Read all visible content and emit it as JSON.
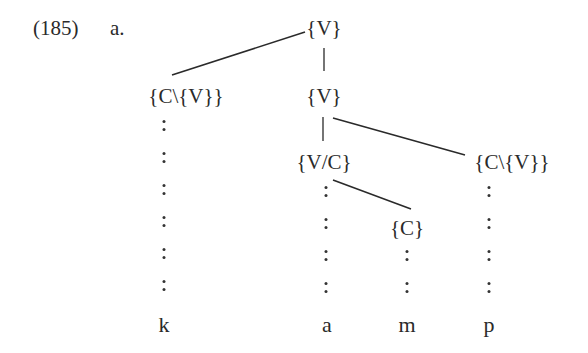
{
  "example": {
    "number": "(185)",
    "sublabel": "a."
  },
  "tree": {
    "nodes": [
      {
        "id": "root",
        "label": "{V}",
        "x": 324,
        "y": 18
      },
      {
        "id": "left-dep",
        "label": "{C\\{V}}",
        "x": 186,
        "y": 86
      },
      {
        "id": "mid",
        "label": "{V}",
        "x": 324,
        "y": 86
      },
      {
        "id": "vc",
        "label": "{V/C}",
        "x": 324,
        "y": 152
      },
      {
        "id": "right-dep",
        "label": "{C\\{V}}",
        "x": 512,
        "y": 152
      },
      {
        "id": "c",
        "label": "{C}",
        "x": 407,
        "y": 218
      }
    ],
    "edges": [
      {
        "from": "root",
        "to": "left-dep",
        "x1": 305,
        "y1": 32,
        "x2": 172,
        "y2": 75
      },
      {
        "from": "root",
        "to": "mid",
        "x1": 324,
        "y1": 48,
        "x2": 324,
        "y2": 71
      },
      {
        "from": "mid",
        "to": "vc",
        "x1": 323,
        "y1": 117,
        "x2": 323,
        "y2": 141
      },
      {
        "from": "mid",
        "to": "right-dep",
        "x1": 333,
        "y1": 118,
        "x2": 465,
        "y2": 155
      },
      {
        "from": "vc",
        "to": "c",
        "x1": 333,
        "y1": 180,
        "x2": 411,
        "y2": 209
      }
    ],
    "leaves": [
      {
        "label": "k",
        "x": 164
      },
      {
        "label": "a",
        "x": 327
      },
      {
        "label": "m",
        "x": 407
      },
      {
        "label": "p",
        "x": 489
      }
    ],
    "association_lines": [
      {
        "x": 164,
        "ys": [
          120,
          152,
          184,
          216,
          248,
          280
        ]
      },
      {
        "x": 326,
        "ys": [
          186,
          218,
          250,
          282
        ]
      },
      {
        "x": 407,
        "ys": [
          250,
          282
        ]
      },
      {
        "x": 489,
        "ys": [
          186,
          218,
          250,
          282
        ]
      }
    ]
  }
}
